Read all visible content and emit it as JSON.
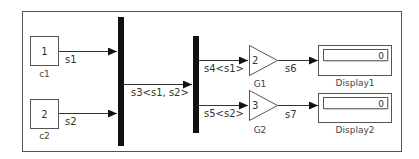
{
  "diagram": {
    "colors": {
      "line": "#333333",
      "bus": "#111111",
      "block_border": "#555555",
      "background": "#ffffff"
    },
    "inports": [
      {
        "id": "c1",
        "number": "1",
        "name": "c1",
        "signal": "s1"
      },
      {
        "id": "c2",
        "number": "2",
        "name": "c2",
        "signal": "s2"
      }
    ],
    "bus_creator": {
      "output_signal": "s3<s1, s2>"
    },
    "bus_selector": {
      "outputs": [
        "s4<s1>",
        "s5<s2>"
      ]
    },
    "gains": [
      {
        "id": "G1",
        "value": "2",
        "name": "G1",
        "output_signal": "s6"
      },
      {
        "id": "G2",
        "value": "3",
        "name": "G2",
        "output_signal": "s7"
      }
    ],
    "displays": [
      {
        "id": "Display1",
        "value": "0",
        "name": "Display1"
      },
      {
        "id": "Display2",
        "value": "0",
        "name": "Display2"
      }
    ]
  }
}
